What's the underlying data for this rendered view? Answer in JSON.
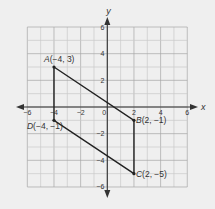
{
  "diagram": {
    "type": "coordinate-plane",
    "axes": {
      "x_label": "x",
      "y_label": "y",
      "x_range": [
        -6,
        6
      ],
      "y_range": [
        -6,
        6
      ],
      "x_ticks": [
        {
          "value": -6,
          "label": "-6"
        },
        {
          "value": -4,
          "label": "-4"
        },
        {
          "value": -2,
          "label": "-2"
        },
        {
          "value": 0,
          "label": "0"
        },
        {
          "value": 2,
          "label": "2"
        },
        {
          "value": 4,
          "label": "4"
        },
        {
          "value": 6,
          "label": "6"
        }
      ],
      "y_ticks": [
        {
          "value": 6,
          "label": "6"
        },
        {
          "value": 4,
          "label": "4"
        },
        {
          "value": 2,
          "label": "2"
        },
        {
          "value": -2,
          "label": "-2"
        },
        {
          "value": -4,
          "label": "-4"
        },
        {
          "value": -6,
          "label": "-6"
        }
      ],
      "grid": true
    },
    "points": [
      {
        "name": "A",
        "x": -4,
        "y": 3,
        "label": "A(−4, 3)",
        "label_pos": "above"
      },
      {
        "name": "B",
        "x": 2,
        "y": -1,
        "label": "B(2, −1)",
        "label_pos": "right"
      },
      {
        "name": "C",
        "x": 2,
        "y": -5,
        "label": "C(2, −5)",
        "label_pos": "right"
      },
      {
        "name": "D",
        "x": -4,
        "y": -1,
        "label": "D(−4, −1)",
        "label_pos": "below-left"
      }
    ],
    "polygon": [
      "A",
      "B",
      "C",
      "D"
    ],
    "colors": {
      "background": "#efefef",
      "grid_major": "#a6a6a6",
      "grid_minor": "#c9c9c9",
      "axis": "#333333",
      "shape": "#222222"
    }
  }
}
